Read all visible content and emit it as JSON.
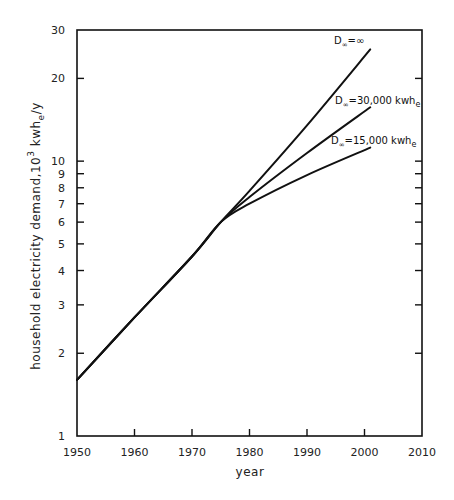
{
  "chart_data": {
    "type": "line",
    "title": "",
    "xlabel": "year",
    "ylabel": "household electricity demand, 10^3 kwh_e/y",
    "yscale": "log",
    "xlim": [
      1950,
      2010
    ],
    "ylim": [
      1,
      30
    ],
    "grid": false,
    "legend_position": "inline labels at line ends",
    "x_ticks": [
      1950,
      1960,
      1970,
      1980,
      1990,
      2000,
      2010
    ],
    "x_tick_labels": [
      "1950",
      "1960",
      "1970",
      "1980",
      "1990",
      "2000",
      "2010"
    ],
    "y_ticks": [
      1,
      2,
      3,
      4,
      5,
      6,
      7,
      8,
      9,
      10,
      20,
      30
    ],
    "y_tick_labels": [
      "1",
      "2",
      "3",
      "4",
      "5",
      "6",
      "7",
      "8",
      "9",
      "10",
      "20",
      "30"
    ],
    "series": [
      {
        "name": "D∞=∞",
        "label_main": "D",
        "label_sub": "∞",
        "label_value": "=∞",
        "x": [
          1950,
          1960,
          1970,
          1975,
          1980,
          1990,
          2001
        ],
        "values": [
          1.6,
          2.7,
          4.5,
          6.0,
          7.8,
          13.5,
          25.5
        ]
      },
      {
        "name": "D∞=30,000 kwh_e",
        "label_main": "D",
        "label_sub": "∞",
        "label_value": "=30,000 kwh",
        "label_unit_sub": "e",
        "x": [
          1950,
          1960,
          1970,
          1975,
          1980,
          1990,
          2001
        ],
        "values": [
          1.6,
          2.7,
          4.5,
          6.0,
          7.4,
          10.7,
          15.7
        ]
      },
      {
        "name": "D∞=15,000 kwh_e",
        "label_main": "D",
        "label_sub": "∞",
        "label_value": "=15,000 kwh",
        "label_unit_sub": "e",
        "x": [
          1950,
          1960,
          1970,
          1975,
          1980,
          1990,
          2001
        ],
        "values": [
          1.6,
          2.7,
          4.5,
          6.0,
          7.0,
          8.9,
          11.2
        ]
      }
    ]
  },
  "labels": {
    "xlabel": "year",
    "ylabel_main": "household electricity demand,10",
    "ylabel_sup": "3",
    "ylabel_unit": " kwh",
    "ylabel_unit_sub": "e",
    "ylabel_tail": "/y"
  }
}
